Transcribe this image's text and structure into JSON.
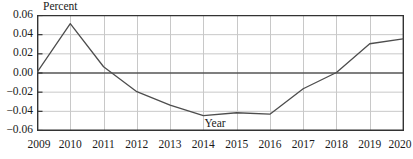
{
  "chart_data": {
    "type": "line",
    "title": "",
    "xlabel": "Year",
    "ylabel": "Percent",
    "x": [
      2009,
      2010,
      2011,
      2012,
      2013,
      2014,
      2015,
      2016,
      2017,
      2018,
      2019,
      2020
    ],
    "xtick_labels": [
      "2009",
      "2010",
      "2011",
      "2012",
      "2013",
      "2014",
      "2015",
      "2016",
      "2017",
      "2018",
      "2019",
      "2020"
    ],
    "values": [
      0.0,
      0.051,
      0.006,
      -0.02,
      -0.034,
      -0.045,
      -0.042,
      -0.0435,
      -0.017,
      0.0,
      0.03,
      0.035
    ],
    "series": [
      {
        "name": "Percent",
        "values": [
          0.0,
          0.051,
          0.006,
          -0.02,
          -0.034,
          -0.045,
          -0.042,
          -0.0435,
          -0.017,
          0.0,
          0.03,
          0.035
        ]
      }
    ],
    "ylim": [
      -0.06,
      0.06
    ],
    "xlim": [
      2009,
      2020
    ],
    "ytick_values": [
      0.06,
      0.04,
      0.02,
      0.0,
      -0.02,
      -0.04,
      -0.06
    ],
    "ytick_labels": [
      "0.06",
      "0.04",
      "0.02",
      "0.00",
      "−0.02",
      "−0.04",
      "−0.06"
    ],
    "grid": true,
    "grid_x": true,
    "grid_y": true,
    "legend": false,
    "legend_position": "none",
    "zero_line": true,
    "annotations": [
      {
        "text": "Percent",
        "position": "top-left-inside"
      },
      {
        "text": "Year",
        "position": "bottom-center-inside"
      }
    ],
    "colors": {
      "line": "#4d4d4d",
      "axis": "#333333",
      "grid": "#c8c8c8",
      "zero_line": "#555555",
      "background": "#ffffff",
      "text": "#1a1a1a"
    }
  }
}
